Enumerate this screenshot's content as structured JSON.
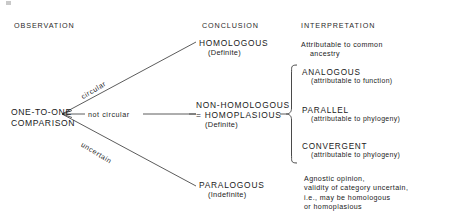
{
  "headers": [
    {
      "label": "OBSERVATION"
    },
    {
      "label": "CONCLUSION"
    },
    {
      "label": "INTERPRETATION"
    }
  ],
  "observation": {
    "root_line1": "ONE-TO-ONE",
    "root_line2": "COMPARISON"
  },
  "branches": [
    {
      "label": "circular",
      "target": "homologous"
    },
    {
      "label": "not  circular",
      "target": "non-homologous"
    },
    {
      "label": "uncertain",
      "target": "paralogous"
    }
  ],
  "conclusions": [
    {
      "name": "HOMOLOGOUS",
      "line2": "",
      "certainty": "(Definite)"
    },
    {
      "name": "NON-HOMOLOGOUS",
      "line2": "= HOMOPLASIOUS",
      "certainty": "(Definite)"
    },
    {
      "name": "PARALOGOUS",
      "line2": "",
      "certainty": "(Indefinite)"
    }
  ],
  "interpretations": {
    "homologous_text_line1": "Attributable to common",
    "homologous_text_line2": "ancestry",
    "braced_items": [
      {
        "name": "ANALOGOUS",
        "detail": "(attributable to function)"
      },
      {
        "name": "PARALLEL",
        "detail": "(attributable to phylogeny)"
      },
      {
        "name": "CONVERGENT",
        "detail": "(attributable to phylogeny)"
      }
    ],
    "paralogous_text": [
      "Agnostic opinion,",
      "validity of category uncertain,",
      "i.e., may be homologous",
      "or homoplasious"
    ]
  },
  "colors": {
    "ink": "#1a1a1a",
    "line": "#4a4a4a",
    "background": "#ffffff"
  }
}
